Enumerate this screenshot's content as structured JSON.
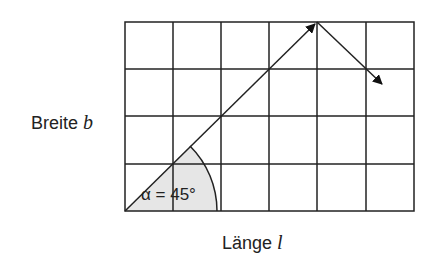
{
  "diagram": {
    "grid": {
      "columns": 6,
      "rows": 4,
      "line_color": "#222222"
    },
    "y_axis_label": {
      "text": "Breite",
      "variable": "b"
    },
    "x_axis_label": {
      "text": "Länge",
      "variable": "l"
    },
    "angle_label": "α = 45°",
    "angle_fill": "#e6e6e6",
    "arrows": [
      {
        "name": "incident",
        "from": [
          0,
          0
        ],
        "to": [
          4,
          4
        ]
      },
      {
        "name": "reflected",
        "from": [
          4,
          4
        ],
        "to": [
          5.35,
          2.7
        ]
      }
    ]
  }
}
